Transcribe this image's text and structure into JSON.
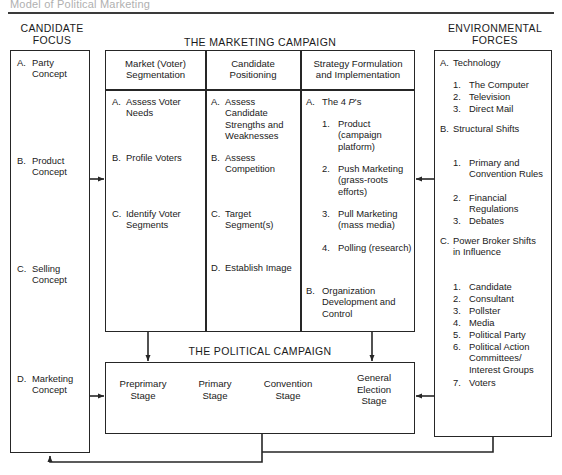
{
  "page": {
    "caption": "Model of Political Marketing"
  },
  "headers": {
    "candidate_focus_line1": "CANDIDATE",
    "candidate_focus_line2": "FOCUS",
    "marketing_campaign": "THE MARKETING CAMPAIGN",
    "environmental_forces_line1": "ENVIRONMENTAL",
    "environmental_forces_line2": "FORCES",
    "political_campaign": "THE POLITICAL CAMPAIGN"
  },
  "candidate_focus": {
    "items": [
      {
        "label": "A.",
        "text": "Party Concept"
      },
      {
        "label": "B.",
        "text": "Product Concept"
      },
      {
        "label": "C.",
        "text": "Selling Concept"
      },
      {
        "label": "D.",
        "text": "Marketing Concept"
      }
    ]
  },
  "marketing_campaign": {
    "columns": [
      {
        "title_line1": "Market (Voter)",
        "title_line2": "Segmentation",
        "items": [
          {
            "label": "A.",
            "text": "Assess Voter Needs"
          },
          {
            "label": "B.",
            "text": "Profile Voters"
          },
          {
            "label": "C.",
            "text": "Identify Voter Segments"
          }
        ]
      },
      {
        "title_line1": "Candidate",
        "title_line2": "Positioning",
        "items": [
          {
            "label": "A.",
            "text": "Assess Candidate Strengths and Weaknesses"
          },
          {
            "label": "B.",
            "text": "Assess Competition"
          },
          {
            "label": "C.",
            "text": "Target Segment(s)"
          },
          {
            "label": "D.",
            "text": "Establish Image"
          }
        ]
      },
      {
        "title_line1": "Strategy Formulation",
        "title_line2": "and Implementation",
        "items": [
          {
            "label": "A.",
            "text_pre": "The 4 ",
            "text_italic": "P",
            "text_post": "'s"
          },
          {
            "label": "B.",
            "text": "Organization Development and Control"
          }
        ],
        "subitems": [
          {
            "label": "1.",
            "text": "Product (campaign platform)"
          },
          {
            "label": "2.",
            "text": "Push Marketing (grass-roots efforts)"
          },
          {
            "label": "3.",
            "text": "Pull Marketing (mass media)"
          },
          {
            "label": "4.",
            "text": "Polling (research)"
          }
        ]
      }
    ]
  },
  "environmental_forces": {
    "groups": [
      {
        "label": "A.",
        "text": "Technology",
        "sub": [
          {
            "label": "1.",
            "text": "The Computer"
          },
          {
            "label": "2.",
            "text": "Television"
          },
          {
            "label": "3.",
            "text": "Direct Mail"
          }
        ]
      },
      {
        "label": "B.",
        "text": "Structural Shifts",
        "sub": [
          {
            "label": "1.",
            "text": "Primary and Convention Rules"
          },
          {
            "label": "2.",
            "text": "Financial Regulations"
          },
          {
            "label": "3.",
            "text": "Debates"
          }
        ]
      },
      {
        "label": "C.",
        "text": "Power Broker Shifts in Influence",
        "sub": [
          {
            "label": "1.",
            "text": "Candidate"
          },
          {
            "label": "2.",
            "text": "Consultant"
          },
          {
            "label": "3.",
            "text": "Pollster"
          },
          {
            "label": "4.",
            "text": "Media"
          },
          {
            "label": "5.",
            "text": "Political Party"
          },
          {
            "label": "6.",
            "text": "Political Action Committees/ Interest Groups"
          },
          {
            "label": "7.",
            "text": "Voters"
          }
        ]
      }
    ]
  },
  "political_campaign": {
    "stages": [
      {
        "line1": "Preprimary",
        "line2": "Stage",
        "line3": ""
      },
      {
        "line1": "Primary",
        "line2": "Stage",
        "line3": ""
      },
      {
        "line1": "Convention",
        "line2": "Stage",
        "line3": ""
      },
      {
        "line1": "General",
        "line2": "Election",
        "line3": "Stage"
      }
    ]
  },
  "colors": {
    "stroke": "#262626",
    "background": "#ffffff",
    "text": "#1a1a1a"
  }
}
